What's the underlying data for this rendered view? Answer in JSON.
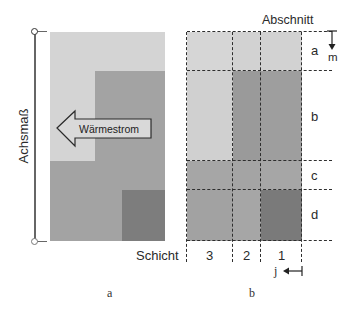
{
  "figure_a": {
    "axis_label": "Achsmaß",
    "arrow_label": "Wärmestrom",
    "caption": "a",
    "colors": {
      "light": "#d4d4d4",
      "medium": "#a3a3a3",
      "dark": "#7d7d7d"
    }
  },
  "figure_b": {
    "top_label": "Abschnitt",
    "sections": [
      "a",
      "b",
      "c",
      "d"
    ],
    "section_direction_label": "m",
    "layer_title": "Schicht",
    "layers": [
      "3",
      "2",
      "1"
    ],
    "layer_direction_label": "j",
    "caption": "b",
    "cells": [
      [
        "#d6d6d6",
        "#d2d2d2",
        "#d2d2d2"
      ],
      [
        "#d0d0d0",
        "#9a9a9a",
        "#9e9e9e"
      ],
      [
        "#a6a6a6",
        "#a4a4a4",
        "#a6a6a6"
      ],
      [
        "#a2a2a2",
        "#a6a6a6",
        "#7a7a7a"
      ]
    ]
  }
}
